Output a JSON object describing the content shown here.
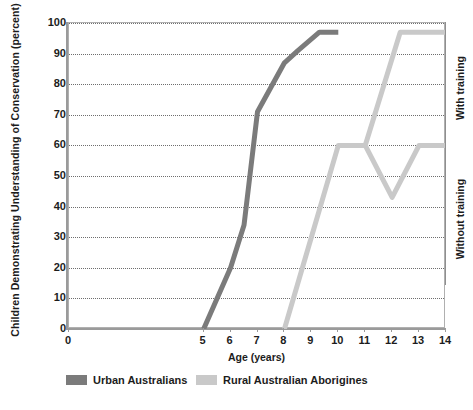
{
  "chart_data": {
    "type": "line",
    "title": "",
    "xlabel": "Age (years)",
    "ylabel": "Children Demonstrating Understanding of Conservation (percent)",
    "xlim": [
      0,
      14
    ],
    "ylim": [
      0,
      100
    ],
    "xticks": [
      0,
      1,
      2,
      3,
      4,
      5,
      6,
      7,
      8,
      9,
      10,
      11,
      12,
      13,
      14
    ],
    "xtick_labels": [
      "0",
      "",
      "",
      "",
      "",
      "5",
      "6",
      "7",
      "8",
      "9",
      "10",
      "11",
      "12",
      "13",
      "14"
    ],
    "yticks": [
      0,
      10,
      20,
      30,
      40,
      50,
      60,
      70,
      80,
      90,
      100
    ],
    "ytick_labels": [
      "0",
      "10",
      "20",
      "30",
      "40",
      "50",
      "60",
      "70",
      "80",
      "90",
      "100"
    ],
    "grid": true,
    "grid_axis": "y",
    "legend_position": "bottom",
    "series": [
      {
        "name": "Urban Australians",
        "color": "#7b7b7b",
        "points": [
          [
            5.0,
            0
          ],
          [
            6.0,
            20
          ],
          [
            6.5,
            34
          ],
          [
            7.0,
            71
          ],
          [
            8.0,
            87
          ],
          [
            8.5,
            91
          ],
          [
            9.3,
            97
          ],
          [
            10.0,
            97
          ]
        ]
      },
      {
        "name": "Rural Australian Aborigines",
        "color": "#c9c9c9",
        "points": [
          [
            8.0,
            0
          ],
          [
            9.0,
            30
          ],
          [
            10.0,
            60
          ],
          [
            11.0,
            60
          ],
          [
            12.3,
            97
          ],
          [
            14.0,
            97
          ]
        ]
      },
      {
        "name": "Rural Australian Aborigines",
        "color": "#c9c9c9",
        "points": [
          [
            10.0,
            60
          ],
          [
            11.0,
            60
          ],
          [
            12.0,
            43
          ],
          [
            13.0,
            60
          ],
          [
            14.0,
            60
          ]
        ]
      }
    ],
    "annotations": [
      {
        "text": "With training",
        "y_range": [
          57,
          100
        ]
      },
      {
        "text": "Without training",
        "y_range": [
          14,
          57
        ]
      }
    ]
  },
  "legend": {
    "items": [
      {
        "label": "Urban Australians",
        "color": "#7b7b7b"
      },
      {
        "label": "Rural Australian Aborigines",
        "color": "#c9c9c9"
      }
    ]
  }
}
